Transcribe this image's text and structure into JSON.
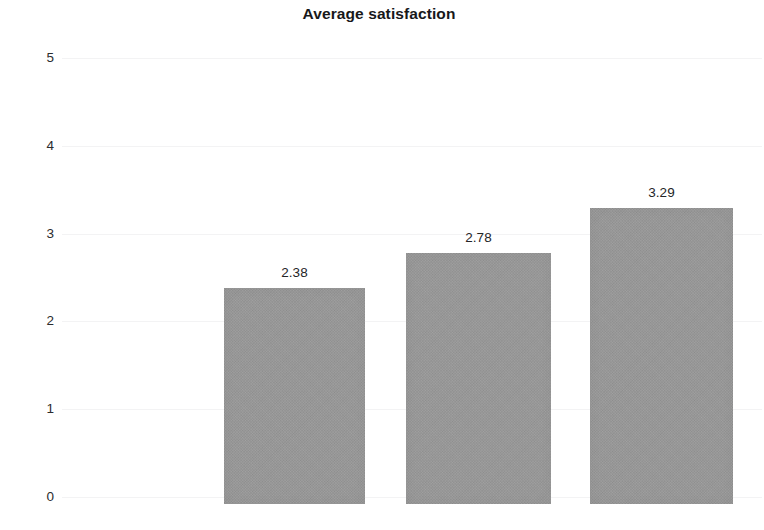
{
  "chart_data": {
    "type": "bar",
    "title": "Average satisfaction",
    "xlabel": "",
    "ylabel": "",
    "categories": [
      "",
      "",
      ""
    ],
    "values": [
      2.38,
      2.78,
      3.29
    ],
    "value_labels": [
      "2.38",
      "2.78",
      "3.29"
    ],
    "ylim": [
      0,
      5
    ],
    "ytick_labels": [
      "5",
      "4",
      "3",
      "2",
      "1",
      "0"
    ],
    "ytick_values": [
      5,
      4,
      3,
      2,
      1,
      0
    ],
    "grid": true,
    "legend": "none",
    "bar_color": "#9b9b9b",
    "background_color": "#ffffff",
    "title_color": "#17181a",
    "tick_color": "#2b2c2e"
  }
}
